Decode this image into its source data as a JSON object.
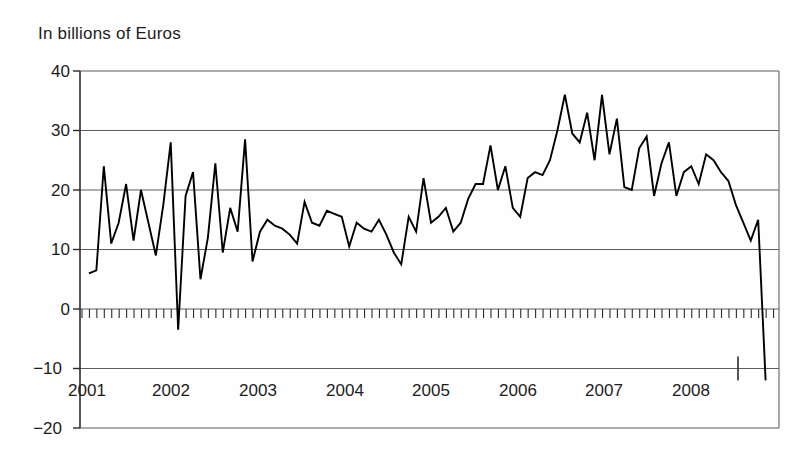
{
  "chart_data": {
    "type": "line",
    "title": "",
    "subtitle": "",
    "ylabel": "In billions of Euros",
    "xlabel": "",
    "ylim": [
      -20,
      40
    ],
    "yticks": [
      40,
      30,
      20,
      10,
      0,
      -10,
      -20
    ],
    "ytick_labels": [
      "40",
      "30",
      "20",
      "10",
      "0",
      "−10",
      "−20"
    ],
    "xlim": [
      "2000-11",
      "2008-07"
    ],
    "xtick_labels": [
      "2001",
      "2002",
      "2003",
      "2004",
      "2005",
      "2006",
      "2007",
      "2008"
    ],
    "grid": "horizontal",
    "legend": "none",
    "minor_ticks": "monthly ticks along zero line",
    "line_color": "#000000",
    "series": [
      {
        "name": "Monthly value",
        "x": [
          "2000-11",
          "2000-12",
          "2001-01",
          "2001-02",
          "2001-03",
          "2001-04",
          "2001-05",
          "2001-06",
          "2001-07",
          "2001-08",
          "2001-09",
          "2001-10",
          "2001-11",
          "2001-12",
          "2002-01",
          "2002-02",
          "2002-03",
          "2002-04",
          "2002-05",
          "2002-06",
          "2002-07",
          "2002-08",
          "2002-09",
          "2002-10",
          "2002-11",
          "2002-12",
          "2003-01",
          "2003-02",
          "2003-03",
          "2003-04",
          "2003-05",
          "2003-06",
          "2003-07",
          "2003-08",
          "2003-09",
          "2003-10",
          "2003-11",
          "2003-12",
          "2004-01",
          "2004-02",
          "2004-03",
          "2004-04",
          "2004-05",
          "2004-06",
          "2004-07",
          "2004-08",
          "2004-09",
          "2004-10",
          "2004-11",
          "2004-12",
          "2005-01",
          "2005-02",
          "2005-03",
          "2005-04",
          "2005-05",
          "2005-06",
          "2005-07",
          "2005-08",
          "2005-09",
          "2005-10",
          "2005-11",
          "2005-12",
          "2006-01",
          "2006-02",
          "2006-03",
          "2006-04",
          "2006-05",
          "2006-06",
          "2006-07",
          "2006-08",
          "2006-09",
          "2006-10",
          "2006-11",
          "2006-12",
          "2007-01",
          "2007-02",
          "2007-03",
          "2007-04",
          "2007-05",
          "2007-06",
          "2007-07",
          "2007-08",
          "2007-09",
          "2007-10",
          "2007-11",
          "2007-12",
          "2008-01",
          "2008-02",
          "2008-03",
          "2008-04",
          "2008-05",
          "2008-06"
        ],
        "values": [
          6,
          6.5,
          24,
          11,
          14.5,
          21,
          11.5,
          20,
          14.5,
          9,
          17.5,
          28,
          -3.5,
          19,
          23,
          5,
          12,
          24.5,
          9.5,
          17,
          13,
          28.5,
          8,
          13,
          15,
          14,
          13.5,
          12.5,
          11,
          18,
          14.5,
          14,
          16.5,
          16,
          15.5,
          10.5,
          14.5,
          13.5,
          13,
          15,
          12.5,
          9.5,
          7.5,
          15.5,
          13,
          22,
          14.5,
          15.5,
          17,
          13,
          14.5,
          18.5,
          21,
          21,
          27.5,
          20,
          24,
          17,
          15.5,
          22,
          23,
          22.5,
          25,
          30,
          36,
          29.5,
          28,
          33,
          25,
          36,
          26,
          32,
          20.5,
          20,
          27,
          29,
          19,
          24.5,
          28,
          19,
          23,
          24,
          21,
          26,
          25,
          23,
          21.5,
          17.5,
          14.5,
          11.5,
          15,
          -12
        ]
      }
    ]
  },
  "axes": {
    "title_label": "In billions of Euros"
  }
}
